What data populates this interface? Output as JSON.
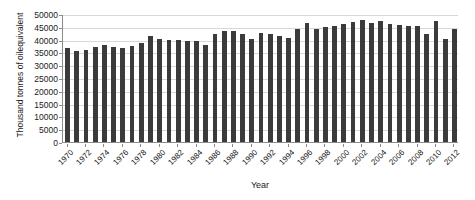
{
  "chart_data": {
    "type": "bar",
    "title": "",
    "xlabel": "Year",
    "ylabel": "Thousand tonnes of oilequivalent",
    "ylim": [
      0,
      50000
    ],
    "ytick_step": 5000,
    "yticks": [
      0,
      5000,
      10000,
      15000,
      20000,
      25000,
      30000,
      35000,
      40000,
      45000,
      50000
    ],
    "ytick_labels": [
      "0",
      "5000",
      "10000",
      "15000",
      "20000",
      "25000",
      "30000",
      "35000",
      "40000",
      "45000",
      "50000"
    ],
    "grid": true,
    "grid_axis": "y",
    "legend": false,
    "legend_position": "none",
    "bar_color": "#3b3b3b",
    "categories": [
      "1970",
      "1971",
      "1972",
      "1973",
      "1974",
      "1975",
      "1976",
      "1977",
      "1978",
      "1979",
      "1980",
      "1981",
      "1982",
      "1983",
      "1984",
      "1985",
      "1986",
      "1987",
      "1988",
      "1989",
      "1990",
      "1991",
      "1992",
      "1993",
      "1994",
      "1995",
      "1996",
      "1997",
      "1998",
      "1999",
      "2000",
      "2001",
      "2002",
      "2003",
      "2004",
      "2005",
      "2006",
      "2007",
      "2008",
      "2009",
      "2010",
      "2011",
      "2012"
    ],
    "xtick_labels": [
      "1970",
      "1972",
      "1974",
      "1976",
      "1978",
      "1980",
      "1982",
      "1984",
      "1986",
      "1988",
      "1990",
      "1992",
      "1994",
      "1996",
      "1998",
      "2000",
      "2002",
      "2004",
      "2006",
      "2008",
      "2010",
      "2012"
    ],
    "values": [
      36700,
      35400,
      36000,
      37300,
      37800,
      37000,
      36800,
      37500,
      38600,
      41400,
      40100,
      40000,
      39700,
      39500,
      39400,
      37900,
      42000,
      43400,
      43300,
      42300,
      40400,
      42500,
      42000,
      41600,
      40800,
      44000,
      46500,
      44300,
      45000,
      45500,
      46100,
      46800,
      47600,
      46600,
      47200,
      46200,
      45600,
      45300,
      45500,
      42200,
      47400,
      40200,
      44200
    ]
  }
}
